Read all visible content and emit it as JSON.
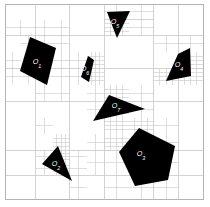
{
  "figure": {
    "type": "quadtree-decomposition-diagram",
    "background_color": "#ffffff",
    "grid_line_color": "#c8c8c8",
    "border_color": "#b4b4b4",
    "obstacle_color": "#000000",
    "label_color": "#ffffff",
    "plot_area": {
      "x": 5,
      "y": 4,
      "width": 198,
      "height": 195
    }
  },
  "obstacles": [
    {
      "id": "O1",
      "label": "O",
      "subscript": "1",
      "shape": "quadrilateral",
      "label_x": 37,
      "label_y": 64,
      "points": "30,37 56,48 47,85 20,71"
    },
    {
      "id": "O2",
      "label": "O",
      "subscript": "2",
      "shape": "triangle",
      "label_x": 56,
      "label_y": 166,
      "points": "58,146 72,181 42,164"
    },
    {
      "id": "O3",
      "label": "O",
      "subscript": "3",
      "shape": "pentagon",
      "label_x": 141,
      "label_y": 156,
      "points": "139,128 175,146 168,180 135,186 119,152"
    },
    {
      "id": "O4",
      "label": "O",
      "subscript": "4",
      "shape": "quadrilateral",
      "label_x": 179,
      "label_y": 67,
      "points": "178,54 190,48 191,76 166,81"
    },
    {
      "id": "O5",
      "label": "O",
      "subscript": "5",
      "shape": "triangle",
      "label_x": 115,
      "label_y": 24,
      "points": "107,12 130,11 117,38"
    },
    {
      "id": "O6",
      "label": "O",
      "subscript": "6",
      "shape": "quadrilateral",
      "label_x": 85,
      "label_y": 71,
      "points": "88,56 94,60 89,82 81,77"
    },
    {
      "id": "O7",
      "label": "O",
      "subscript": "7",
      "shape": "triangle",
      "label_x": 116,
      "label_y": 108,
      "points": "109,95 145,109 93,121"
    }
  ],
  "mesh": {
    "border_rect": {
      "x": 5,
      "y": 4,
      "width": 198,
      "height": 195
    },
    "coarse_lines": [
      {
        "orientation": "v",
        "x": 35.75,
        "y1": 4,
        "y2": 199
      },
      {
        "orientation": "v",
        "x": 104.0,
        "y1": 4,
        "y2": 199
      },
      {
        "orientation": "v",
        "x": 153.5,
        "y1": 4,
        "y2": 199
      },
      {
        "orientation": "h",
        "y": 35.5,
        "x1": 5,
        "x2": 203
      },
      {
        "orientation": "h",
        "y": 101.5,
        "x1": 5,
        "x2": 203
      },
      {
        "orientation": "h",
        "y": 150.0,
        "x1": 5,
        "x2": 203
      },
      {
        "orientation": "v",
        "x": 69.5,
        "y1": 4,
        "y2": 101.5
      },
      {
        "orientation": "v",
        "x": 69.5,
        "y1": 101.5,
        "y2": 199
      },
      {
        "orientation": "v",
        "x": 178.5,
        "y1": 4,
        "y2": 199
      },
      {
        "orientation": "h",
        "y": 68.5,
        "x1": 5,
        "x2": 203
      },
      {
        "orientation": "h",
        "y": 175.0,
        "x1": 5,
        "x2": 203
      },
      {
        "orientation": "h",
        "y": 19.5,
        "x1": 104.0,
        "x2": 153.5
      }
    ],
    "refined_blocks": [
      {
        "x": 5,
        "y": 19.5,
        "w": 30.75,
        "h": 16,
        "div": 2
      },
      {
        "x": 20.5,
        "y": 35.5,
        "w": 15.25,
        "h": 16.5,
        "div": 2
      },
      {
        "x": 5,
        "y": 52,
        "w": 15.5,
        "h": 16.5,
        "div": 2
      },
      {
        "x": 5,
        "y": 68.5,
        "w": 15.5,
        "h": 16.5,
        "div": 2
      },
      {
        "x": 20.5,
        "y": 68.5,
        "w": 15.25,
        "h": 16.5,
        "div": 2
      },
      {
        "x": 35.75,
        "y": 19.5,
        "w": 16.75,
        "h": 16,
        "div": 2
      },
      {
        "x": 52.5,
        "y": 19.5,
        "w": 17,
        "h": 16,
        "div": 2
      },
      {
        "x": 35.75,
        "y": 35.5,
        "w": 16.75,
        "h": 16.5,
        "div": 2
      },
      {
        "x": 52.5,
        "y": 35.5,
        "w": 17,
        "h": 16.5,
        "div": 2
      },
      {
        "x": 52.5,
        "y": 52,
        "w": 17,
        "h": 16.5,
        "div": 2
      },
      {
        "x": 35.75,
        "y": 68.5,
        "w": 16.75,
        "h": 16.5,
        "div": 2
      },
      {
        "x": 52.5,
        "y": 68.5,
        "w": 17,
        "h": 16.5,
        "div": 2
      },
      {
        "x": 35.75,
        "y": 85,
        "w": 16.75,
        "h": 16.5,
        "div": 2
      },
      {
        "x": 52.5,
        "y": 85,
        "w": 17,
        "h": 16.5,
        "div": 2
      },
      {
        "x": 69.5,
        "y": 52,
        "w": 17.25,
        "h": 16.5,
        "div": 2
      },
      {
        "x": 86.75,
        "y": 52,
        "w": 17.25,
        "h": 16.5,
        "div": 4
      },
      {
        "x": 69.5,
        "y": 68.5,
        "w": 17.25,
        "h": 16.5,
        "div": 2
      },
      {
        "x": 86.75,
        "y": 68.5,
        "w": 17.25,
        "h": 16.5,
        "div": 4
      },
      {
        "x": 86.75,
        "y": 85,
        "w": 17.25,
        "h": 16.5,
        "div": 2
      },
      {
        "x": 104.0,
        "y": 4,
        "w": 24.75,
        "h": 15.5,
        "div": 2
      },
      {
        "x": 128.75,
        "y": 4,
        "w": 24.75,
        "h": 15.5,
        "div": 2
      },
      {
        "x": 104.0,
        "y": 19.5,
        "w": 24.75,
        "h": 16,
        "div": 4
      },
      {
        "x": 128.75,
        "y": 19.5,
        "w": 24.75,
        "h": 16,
        "div": 2
      },
      {
        "x": 153.5,
        "y": 35.5,
        "w": 25,
        "h": 16.5,
        "div": 2
      },
      {
        "x": 178.5,
        "y": 35.5,
        "w": 24.5,
        "h": 16.5,
        "div": 2
      },
      {
        "x": 178.5,
        "y": 52,
        "w": 24.5,
        "h": 16.5,
        "div": 4
      },
      {
        "x": 153.5,
        "y": 68.5,
        "w": 25,
        "h": 16.5,
        "div": 4
      },
      {
        "x": 178.5,
        "y": 68.5,
        "w": 24.5,
        "h": 16.5,
        "div": 4
      },
      {
        "x": 104.0,
        "y": 85,
        "w": 24.75,
        "h": 16.5,
        "div": 4
      },
      {
        "x": 128.75,
        "y": 85,
        "w": 24.75,
        "h": 16.5,
        "div": 2
      },
      {
        "x": 86.75,
        "y": 101.5,
        "w": 17.25,
        "h": 16.25,
        "div": 2
      },
      {
        "x": 104.0,
        "y": 101.5,
        "w": 24.75,
        "h": 16.25,
        "div": 4
      },
      {
        "x": 128.75,
        "y": 101.5,
        "w": 24.75,
        "h": 16.25,
        "div": 2
      },
      {
        "x": 104.0,
        "y": 117.75,
        "w": 24.75,
        "h": 16.25,
        "div": 4
      },
      {
        "x": 128.75,
        "y": 117.75,
        "w": 24.75,
        "h": 16.25,
        "div": 4
      },
      {
        "x": 153.5,
        "y": 117.75,
        "w": 25,
        "h": 16.25,
        "div": 2
      },
      {
        "x": 104.0,
        "y": 134,
        "w": 24.75,
        "h": 16,
        "div": 4
      },
      {
        "x": 153.5,
        "y": 134,
        "w": 25,
        "h": 16,
        "div": 2
      },
      {
        "x": 104.0,
        "y": 150,
        "w": 24.75,
        "h": 25,
        "div": 2
      },
      {
        "x": 153.5,
        "y": 150,
        "w": 25,
        "h": 25,
        "div": 2
      },
      {
        "x": 104.0,
        "y": 175,
        "w": 24.75,
        "h": 24,
        "div": 2
      },
      {
        "x": 128.75,
        "y": 175,
        "w": 24.75,
        "h": 24,
        "div": 2
      },
      {
        "x": 153.5,
        "y": 175,
        "w": 25,
        "h": 24,
        "div": 2
      },
      {
        "x": 35.75,
        "y": 117.75,
        "w": 16.75,
        "h": 16.25,
        "div": 2
      },
      {
        "x": 52.5,
        "y": 134,
        "w": 17,
        "h": 16,
        "div": 4
      },
      {
        "x": 35.75,
        "y": 150,
        "w": 16.75,
        "h": 12.5,
        "div": 2
      },
      {
        "x": 52.5,
        "y": 150,
        "w": 17,
        "h": 12.5,
        "div": 4
      },
      {
        "x": 35.75,
        "y": 162.5,
        "w": 16.75,
        "h": 12.5,
        "div": 2
      },
      {
        "x": 52.5,
        "y": 162.5,
        "w": 17,
        "h": 12.5,
        "div": 4
      },
      {
        "x": 69.5,
        "y": 150,
        "w": 17.25,
        "h": 12.5,
        "div": 2
      },
      {
        "x": 69.5,
        "y": 162.5,
        "w": 17.25,
        "h": 12.5,
        "div": 2
      },
      {
        "x": 69.5,
        "y": 175,
        "w": 17.25,
        "h": 24,
        "div": 2
      },
      {
        "x": 86.75,
        "y": 134,
        "w": 17.25,
        "h": 16,
        "div": 2
      },
      {
        "x": 86.75,
        "y": 150,
        "w": 17.25,
        "h": 25,
        "div": 2
      }
    ]
  }
}
